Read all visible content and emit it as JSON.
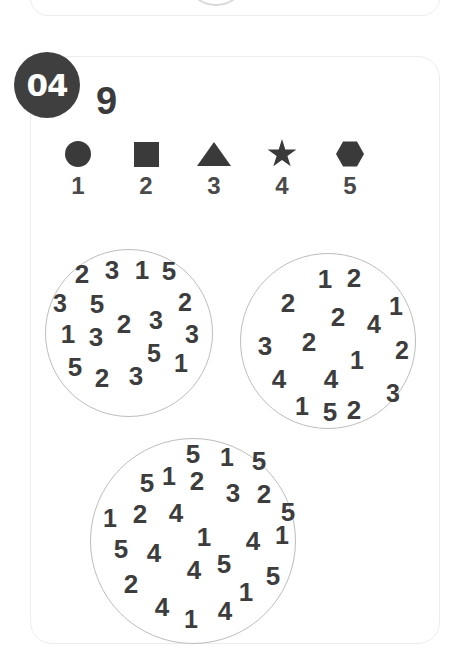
{
  "card": {
    "badge_label": "04",
    "target_number": "9"
  },
  "legend": {
    "items": [
      {
        "icon": "circle-icon",
        "shape": "circle",
        "label": "1"
      },
      {
        "icon": "square-icon",
        "shape": "square",
        "label": "2"
      },
      {
        "icon": "triangle-icon",
        "shape": "triangle",
        "label": "3"
      },
      {
        "icon": "star-icon",
        "shape": "star",
        "label": "4"
      },
      {
        "icon": "hexagon-icon",
        "shape": "hexagon",
        "label": "5"
      }
    ]
  },
  "colors": {
    "ink": "#3d3d3d",
    "badge_fill": "#3f3f3f",
    "badge_text": "#ffffff",
    "circle_stroke": "#bdbdbd",
    "card_border": "#ededed",
    "background": "#ffffff"
  },
  "groups": [
    {
      "name": "left-circle",
      "digits": [
        {
          "value": "2",
          "x": 36,
          "y": 24,
          "size": 26
        },
        {
          "value": "3",
          "x": 66,
          "y": 20,
          "size": 26
        },
        {
          "value": "1",
          "x": 96,
          "y": 20,
          "size": 26
        },
        {
          "value": "5",
          "x": 123,
          "y": 21,
          "size": 26
        },
        {
          "value": "3",
          "x": 14,
          "y": 53,
          "size": 25
        },
        {
          "value": "5",
          "x": 51,
          "y": 54,
          "size": 26
        },
        {
          "value": "2",
          "x": 139,
          "y": 52,
          "size": 25
        },
        {
          "value": "2",
          "x": 78,
          "y": 74,
          "size": 26
        },
        {
          "value": "3",
          "x": 110,
          "y": 70,
          "size": 25
        },
        {
          "value": "1",
          "x": 22,
          "y": 84,
          "size": 26
        },
        {
          "value": "3",
          "x": 50,
          "y": 87,
          "size": 26
        },
        {
          "value": "3",
          "x": 146,
          "y": 84,
          "size": 25
        },
        {
          "value": "5",
          "x": 108,
          "y": 103,
          "size": 25
        },
        {
          "value": "5",
          "x": 29,
          "y": 117,
          "size": 26
        },
        {
          "value": "1",
          "x": 135,
          "y": 113,
          "size": 25
        },
        {
          "value": "2",
          "x": 56,
          "y": 128,
          "size": 26
        },
        {
          "value": "3",
          "x": 90,
          "y": 126,
          "size": 26
        }
      ]
    },
    {
      "name": "right-circle",
      "digits": [
        {
          "value": "1",
          "x": 84,
          "y": 25,
          "size": 26
        },
        {
          "value": "2",
          "x": 113,
          "y": 24,
          "size": 26
        },
        {
          "value": "2",
          "x": 47,
          "y": 49,
          "size": 26
        },
        {
          "value": "2",
          "x": 97,
          "y": 63,
          "size": 26
        },
        {
          "value": "4",
          "x": 133,
          "y": 70,
          "size": 25
        },
        {
          "value": "1",
          "x": 155,
          "y": 52,
          "size": 25
        },
        {
          "value": "3",
          "x": 24,
          "y": 92,
          "size": 26
        },
        {
          "value": "2",
          "x": 68,
          "y": 88,
          "size": 26
        },
        {
          "value": "2",
          "x": 161,
          "y": 96,
          "size": 25
        },
        {
          "value": "1",
          "x": 116,
          "y": 106,
          "size": 25
        },
        {
          "value": "4",
          "x": 38,
          "y": 125,
          "size": 26
        },
        {
          "value": "4",
          "x": 90,
          "y": 125,
          "size": 26
        },
        {
          "value": "3",
          "x": 152,
          "y": 139,
          "size": 25
        },
        {
          "value": "1",
          "x": 61,
          "y": 152,
          "size": 25
        },
        {
          "value": "5",
          "x": 89,
          "y": 158,
          "size": 26
        },
        {
          "value": "2",
          "x": 113,
          "y": 156,
          "size": 26
        }
      ]
    },
    {
      "name": "bottom-circle",
      "digits": [
        {
          "value": "5",
          "x": 102,
          "y": 15,
          "size": 26
        },
        {
          "value": "1",
          "x": 136,
          "y": 18,
          "size": 25
        },
        {
          "value": "5",
          "x": 168,
          "y": 22,
          "size": 26
        },
        {
          "value": "5",
          "x": 56,
          "y": 44,
          "size": 26
        },
        {
          "value": "1",
          "x": 78,
          "y": 37,
          "size": 25
        },
        {
          "value": "2",
          "x": 106,
          "y": 42,
          "size": 26
        },
        {
          "value": "3",
          "x": 142,
          "y": 54,
          "size": 26
        },
        {
          "value": "2",
          "x": 173,
          "y": 55,
          "size": 26
        },
        {
          "value": "1",
          "x": 19,
          "y": 79,
          "size": 25
        },
        {
          "value": "2",
          "x": 49,
          "y": 75,
          "size": 26
        },
        {
          "value": "4",
          "x": 85,
          "y": 74,
          "size": 26
        },
        {
          "value": "5",
          "x": 197,
          "y": 73,
          "size": 26
        },
        {
          "value": "1",
          "x": 113,
          "y": 98,
          "size": 26
        },
        {
          "value": "4",
          "x": 162,
          "y": 102,
          "size": 26
        },
        {
          "value": "1",
          "x": 191,
          "y": 96,
          "size": 25
        },
        {
          "value": "5",
          "x": 30,
          "y": 110,
          "size": 26
        },
        {
          "value": "4",
          "x": 63,
          "y": 114,
          "size": 26
        },
        {
          "value": "4",
          "x": 103,
          "y": 131,
          "size": 26
        },
        {
          "value": "5",
          "x": 133,
          "y": 125,
          "size": 26
        },
        {
          "value": "5",
          "x": 182,
          "y": 137,
          "size": 26
        },
        {
          "value": "2",
          "x": 40,
          "y": 145,
          "size": 26
        },
        {
          "value": "1",
          "x": 155,
          "y": 153,
          "size": 26
        },
        {
          "value": "4",
          "x": 71,
          "y": 168,
          "size": 26
        },
        {
          "value": "1",
          "x": 100,
          "y": 180,
          "size": 25
        },
        {
          "value": "4",
          "x": 134,
          "y": 172,
          "size": 26
        }
      ]
    }
  ]
}
